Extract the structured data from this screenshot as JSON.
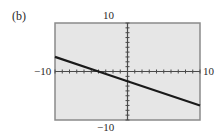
{
  "panel_label": "(b)",
  "axis_labels": {
    "y_max": "10",
    "y_min": "−10",
    "x_min": "−10",
    "x_max": "10"
  },
  "colors": {
    "background": "#e6e6e6",
    "frame": "#8a8a8a",
    "axes": "#4a4a4a",
    "line": "#1a1a1a"
  },
  "chart_data": {
    "type": "line",
    "title": "(b)",
    "xlabel": "",
    "ylabel": "",
    "xlim": [
      -10,
      10
    ],
    "ylim": [
      -10,
      10
    ],
    "x_tick_step": 1,
    "y_tick_step": 1,
    "grid": false,
    "legend": "none",
    "tick_labels": {
      "x": [
        "-10",
        "10"
      ],
      "y": [
        "-10",
        "10"
      ]
    },
    "series": [
      {
        "name": "y = -0.5x - 2",
        "x": [
          -10,
          -4,
          0,
          10
        ],
        "y": [
          3,
          0,
          -2,
          -7
        ]
      }
    ]
  }
}
